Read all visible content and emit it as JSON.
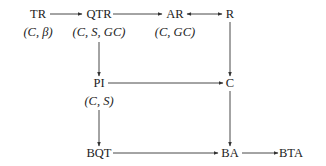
{
  "nodes": {
    "TR": {
      "label": "TR",
      "sub": "(C, β)"
    },
    "QTR": {
      "label": "QTR",
      "sub": "(C, S, GC)"
    },
    "AR": {
      "label": "AR",
      "sub": "(C, GC)"
    },
    "R": {
      "label": "R"
    },
    "PI": {
      "label": "PI",
      "sub": "(C, S)"
    },
    "C": {
      "label": "C"
    },
    "BQT": {
      "label": "BQT"
    },
    "BA": {
      "label": "BA"
    },
    "BTA": {
      "label": "BTA"
    }
  },
  "edges": [
    {
      "from": "TR",
      "to": "QTR",
      "direction": "forward"
    },
    {
      "from": "QTR",
      "to": "AR",
      "direction": "forward"
    },
    {
      "from": "AR",
      "to": "R",
      "direction": "bidirectional"
    },
    {
      "from": "QTR",
      "to": "PI",
      "direction": "forward"
    },
    {
      "from": "R",
      "to": "C",
      "direction": "forward"
    },
    {
      "from": "PI",
      "to": "C",
      "direction": "forward"
    },
    {
      "from": "PI",
      "to": "BQT",
      "direction": "forward"
    },
    {
      "from": "C",
      "to": "BA",
      "direction": "forward"
    },
    {
      "from": "BQT",
      "to": "BA",
      "direction": "forward"
    },
    {
      "from": "BA",
      "to": "BTA",
      "direction": "forward"
    }
  ],
  "colors": {
    "line": "#333333",
    "text": "#222222"
  }
}
